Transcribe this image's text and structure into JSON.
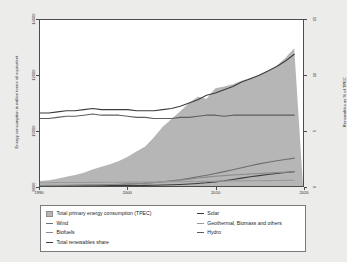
{
  "chart_data": {
    "type": "area",
    "title": "",
    "xlabel": "",
    "ylabel": "Energy consumption in million tonne oil equivalent",
    "ylabel_right": "Renewables as % of TPEC",
    "xlim": [
      1990,
      2020
    ],
    "ylim_left": [
      8000,
      14000
    ],
    "ylim_right": [
      0,
      15
    ],
    "xticks": [
      "1990",
      "2000",
      "2010",
      "2020"
    ],
    "xtick_values": [
      1990,
      2000,
      2010,
      2020
    ],
    "yticks_left": [
      "8000",
      "10000",
      "12000",
      "14000"
    ],
    "ytick_left_values": [
      8000,
      10000,
      12000,
      14000
    ],
    "yticks_right": [
      "0",
      "5",
      "10",
      "15"
    ],
    "ytick_right_values": [
      0,
      5,
      10,
      15
    ],
    "grid": false,
    "legend_position": "below",
    "x": [
      1990,
      1991,
      1992,
      1993,
      1994,
      1995,
      1996,
      1997,
      1998,
      1999,
      2000,
      2001,
      2002,
      2003,
      2004,
      2005,
      2006,
      2007,
      2008,
      2009,
      2010,
      2011,
      2012,
      2013,
      2014,
      2015,
      2016,
      2017,
      2018,
      2019
    ],
    "series": [
      {
        "name": "Total primary energy consumption (TPEC)",
        "axis": "left",
        "kind": "area",
        "color": "#b6b6b6",
        "values": [
          8180,
          8210,
          8260,
          8330,
          8400,
          8480,
          8600,
          8700,
          8790,
          8900,
          9060,
          9250,
          9430,
          9760,
          10140,
          10420,
          10700,
          11000,
          11230,
          11150,
          11530,
          11600,
          11680,
          11800,
          11900,
          12010,
          12150,
          12340,
          12640,
          12980
        ]
      },
      {
        "name": "Total renewables share",
        "axis": "right",
        "kind": "line",
        "color": "#3c3c3c",
        "values": [
          6.6,
          6.6,
          6.7,
          6.8,
          6.8,
          6.9,
          7.0,
          6.9,
          6.9,
          6.9,
          6.9,
          6.8,
          6.8,
          6.8,
          6.9,
          7.0,
          7.2,
          7.5,
          7.8,
          8.2,
          8.4,
          8.7,
          9.0,
          9.4,
          9.7,
          10.0,
          10.4,
          10.8,
          11.3,
          11.9
        ]
      },
      {
        "name": "Hydro",
        "axis": "right",
        "kind": "line",
        "color": "#5e5e5e",
        "values": [
          6.1,
          6.1,
          6.2,
          6.3,
          6.3,
          6.4,
          6.5,
          6.4,
          6.4,
          6.4,
          6.3,
          6.2,
          6.2,
          6.1,
          6.1,
          6.1,
          6.2,
          6.2,
          6.3,
          6.4,
          6.4,
          6.3,
          6.4,
          6.4,
          6.4,
          6.4,
          6.4,
          6.4,
          6.4,
          6.4
        ]
      },
      {
        "name": "Wind",
        "axis": "right",
        "kind": "line",
        "color": "#6e6e6e",
        "values": [
          0.02,
          0.02,
          0.03,
          0.04,
          0.05,
          0.06,
          0.07,
          0.09,
          0.11,
          0.14,
          0.17,
          0.21,
          0.26,
          0.32,
          0.39,
          0.47,
          0.57,
          0.69,
          0.83,
          0.97,
          1.13,
          1.3,
          1.47,
          1.65,
          1.83,
          2.0,
          2.15,
          2.28,
          2.4,
          2.52
        ]
      },
      {
        "name": "Solar",
        "axis": "right",
        "kind": "line",
        "color": "#3c3c3c",
        "values": [
          0.01,
          0.01,
          0.01,
          0.01,
          0.01,
          0.02,
          0.02,
          0.02,
          0.03,
          0.03,
          0.04,
          0.05,
          0.06,
          0.07,
          0.09,
          0.11,
          0.14,
          0.18,
          0.23,
          0.29,
          0.37,
          0.47,
          0.59,
          0.71,
          0.83,
          0.94,
          1.04,
          1.13,
          1.22,
          1.3
        ]
      },
      {
        "name": "Biofuels",
        "axis": "right",
        "kind": "line",
        "color": "#8a8a8a",
        "values": [
          0.05,
          0.06,
          0.06,
          0.07,
          0.08,
          0.09,
          0.1,
          0.11,
          0.13,
          0.15,
          0.18,
          0.21,
          0.25,
          0.3,
          0.36,
          0.43,
          0.52,
          0.62,
          0.72,
          0.8,
          0.88,
          0.94,
          0.99,
          1.04,
          1.09,
          1.13,
          1.17,
          1.21,
          1.25,
          1.29
        ]
      },
      {
        "name": "Geothermal, Biomass and others",
        "axis": "right",
        "kind": "line",
        "color": "#9a9a9a",
        "values": [
          0.3,
          0.3,
          0.31,
          0.31,
          0.32,
          0.32,
          0.33,
          0.33,
          0.34,
          0.34,
          0.35,
          0.35,
          0.36,
          0.36,
          0.37,
          0.38,
          0.39,
          0.4,
          0.41,
          0.42,
          0.43,
          0.44,
          0.45,
          0.46,
          0.47,
          0.48,
          0.49,
          0.5,
          0.51,
          0.52
        ]
      }
    ]
  },
  "axes": {
    "left_title": "Energy consumption in million tonne oil equivalent",
    "right_title": "Renewables as % of TPEC",
    "y_left_ticks": [
      "14000",
      "12000",
      "10000",
      "8000"
    ],
    "y_right_ticks": [
      "15",
      "10",
      "5",
      "0"
    ],
    "x_ticks": [
      "1990",
      "2000",
      "2010",
      "2020"
    ]
  },
  "legend": {
    "left_column": [
      {
        "label": "Total primary energy consumption (TPEC)",
        "marker": "area",
        "color": "#b6b6b6"
      },
      {
        "label": "Wind",
        "marker": "line",
        "color": "#6e6e6e"
      },
      {
        "label": "Biofuels",
        "marker": "line",
        "color": "#8a8a8a"
      },
      {
        "label": "Total renewables share",
        "marker": "line",
        "color": "#3c3c3c"
      }
    ],
    "right_column": [
      {
        "label": "Solar",
        "marker": "line",
        "color": "#3c3c3c"
      },
      {
        "label": "Geothermal, Biomass and others",
        "marker": "line",
        "color": "#9a9a9a"
      },
      {
        "label": "Hydro",
        "marker": "line",
        "color": "#5e5e5e"
      }
    ]
  }
}
